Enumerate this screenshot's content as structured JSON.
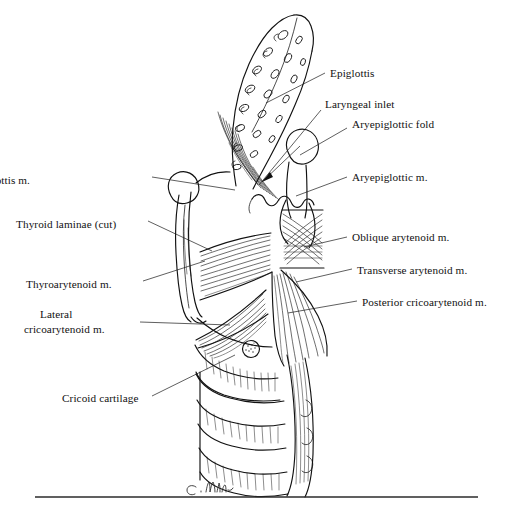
{
  "figure": {
    "artist_signature": "C. Wild",
    "ink_color": "#111111",
    "background_color": "#ffffff"
  },
  "labels": {
    "left": [
      {
        "id": "thyroepiglottis",
        "text": "Thyroepiglottis m.",
        "x": 30,
        "y": 180
      },
      {
        "id": "thyroid-laminae",
        "text": "Thyroid laminae (cut)",
        "x": 16,
        "y": 224
      },
      {
        "id": "thyroarytenoid",
        "text": "Thyroarytenoid m.",
        "x": 26,
        "y": 285
      },
      {
        "id": "lateral-cricoarytenoid-line1",
        "text": "Lateral",
        "x": 40,
        "y": 315
      },
      {
        "id": "lateral-cricoarytenoid-line2",
        "text": "cricoarytenoid m.",
        "x": 24,
        "y": 330
      },
      {
        "id": "cricoid-cartilage",
        "text": "Cricoid cartilage",
        "x": 62,
        "y": 399
      }
    ],
    "right": [
      {
        "id": "epiglottis",
        "text": "Epiglottis",
        "x": 330,
        "y": 76
      },
      {
        "id": "laryngeal-inlet",
        "text": "Laryngeal inlet",
        "x": 325,
        "y": 106
      },
      {
        "id": "aryepiglottic-fold",
        "text": "Aryepiglottic fold",
        "x": 352,
        "y": 125
      },
      {
        "id": "aryepiglottic-muscle",
        "text": "Aryepiglottic m.",
        "x": 352,
        "y": 180
      },
      {
        "id": "oblique-arytenoid",
        "text": "Oblique arytenoid m.",
        "x": 352,
        "y": 240
      },
      {
        "id": "transverse-arytenoid",
        "text": "Transverse arytenoid m.",
        "x": 357,
        "y": 273
      },
      {
        "id": "posterior-cricoarytenoid",
        "text": "Posterior cricoarytenoid m.",
        "x": 362,
        "y": 305
      }
    ]
  }
}
